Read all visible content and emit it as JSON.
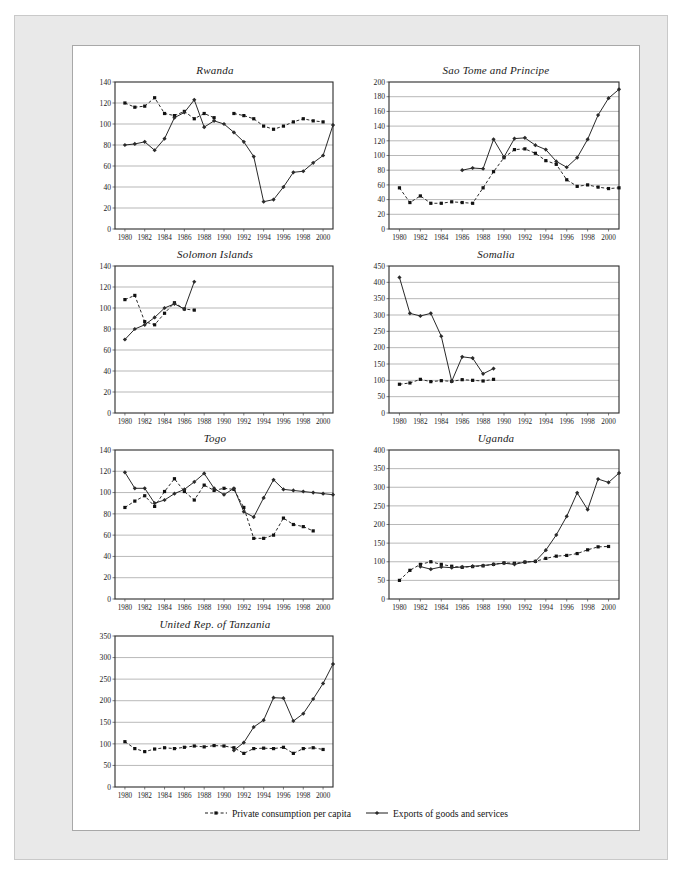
{
  "legend": [
    {
      "label": "Private consumption per capita",
      "marker": "square",
      "dash": true
    },
    {
      "label": "Exports of goods and services",
      "marker": "diamond",
      "dash": false
    }
  ],
  "series_names": {
    "consumption": "Private consumption per capita",
    "exports": "Exports of goods and services"
  },
  "xticks": [
    "1980",
    "1982",
    "1984",
    "1986",
    "1988",
    "1990",
    "1992",
    "1994",
    "1996",
    "1998",
    "2000"
  ],
  "chart_data": [
    {
      "type": "line",
      "title": "Rwanda",
      "xlabel": "",
      "ylabel": "",
      "grid": true,
      "legend_position": "bottom-shared",
      "xlim": [
        1979,
        2001
      ],
      "ylim": [
        0,
        140
      ],
      "yticks": [
        0,
        20,
        40,
        60,
        80,
        100,
        120,
        140
      ],
      "x": [
        1980,
        1981,
        1982,
        1983,
        1984,
        1985,
        1986,
        1987,
        1988,
        1989,
        1990,
        1991,
        1992,
        1993,
        1994,
        1995,
        1996,
        1997,
        1998,
        1999,
        2000,
        2001
      ],
      "series": [
        {
          "name": "Private consumption per capita",
          "marker": "square",
          "dash": true,
          "values": [
            120,
            116,
            117,
            125,
            110,
            108,
            112,
            105,
            110,
            106,
            null,
            110,
            108,
            105,
            98,
            95,
            98,
            102,
            105,
            103,
            102,
            null
          ]
        },
        {
          "name": "Exports of goods and services",
          "marker": "diamond",
          "dash": false,
          "values": [
            80,
            81,
            83,
            75,
            86,
            106,
            111,
            123,
            97,
            103,
            100,
            92,
            83,
            69,
            26,
            28,
            40,
            54,
            55,
            63,
            70,
            99
          ]
        }
      ]
    },
    {
      "type": "line",
      "title": "Sao Tome and Principe",
      "xlabel": "",
      "ylabel": "",
      "grid": true,
      "legend_position": "bottom-shared",
      "xlim": [
        1979,
        2001
      ],
      "ylim": [
        0,
        200
      ],
      "yticks": [
        0,
        20,
        40,
        60,
        80,
        100,
        120,
        140,
        160,
        180,
        200
      ],
      "x": [
        1980,
        1981,
        1982,
        1983,
        1984,
        1985,
        1986,
        1987,
        1988,
        1989,
        1990,
        1991,
        1992,
        1993,
        1994,
        1995,
        1996,
        1997,
        1998,
        1999,
        2000,
        2001
      ],
      "series": [
        {
          "name": "Private consumption per capita",
          "marker": "square",
          "dash": true,
          "values": [
            56,
            36,
            45,
            35,
            35,
            37,
            36,
            35,
            56,
            78,
            97,
            108,
            109,
            103,
            93,
            88,
            67,
            58,
            60,
            57,
            55,
            56
          ]
        },
        {
          "name": "Exports of goods and services",
          "marker": "diamond",
          "dash": false,
          "values": [
            null,
            null,
            null,
            null,
            null,
            null,
            80,
            83,
            82,
            122,
            98,
            123,
            124,
            114,
            108,
            92,
            84,
            97,
            122,
            155,
            178,
            190
          ]
        }
      ]
    },
    {
      "type": "line",
      "title": "Solomon Islands",
      "xlabel": "",
      "ylabel": "",
      "grid": true,
      "legend_position": "bottom-shared",
      "xlim": [
        1979,
        2001
      ],
      "ylim": [
        0,
        140
      ],
      "yticks": [
        0,
        20,
        40,
        60,
        80,
        100,
        120,
        140
      ],
      "x": [
        1980,
        1981,
        1982,
        1983,
        1984,
        1985,
        1986,
        1987,
        1988,
        1989,
        1990,
        1991,
        1992,
        1993,
        1994,
        1995,
        1996,
        1997,
        1998,
        1999,
        2000,
        2001
      ],
      "series": [
        {
          "name": "Private consumption per capita",
          "marker": "square",
          "dash": true,
          "values": [
            108,
            112,
            87,
            84,
            95,
            105,
            99,
            98,
            null,
            null,
            null,
            null,
            null,
            null,
            null,
            null,
            null,
            null,
            null,
            null,
            null,
            null
          ]
        },
        {
          "name": "Exports of goods and services",
          "marker": "diamond",
          "dash": false,
          "values": [
            70,
            80,
            84,
            91,
            100,
            104,
            99,
            125,
            null,
            null,
            null,
            null,
            null,
            null,
            null,
            null,
            null,
            null,
            null,
            null,
            null,
            null
          ]
        }
      ]
    },
    {
      "type": "line",
      "title": "Somalia",
      "xlabel": "",
      "ylabel": "",
      "grid": true,
      "legend_position": "bottom-shared",
      "xlim": [
        1979,
        2001
      ],
      "ylim": [
        0,
        450
      ],
      "yticks": [
        0,
        50,
        100,
        150,
        200,
        250,
        300,
        350,
        400,
        450
      ],
      "x": [
        1980,
        1981,
        1982,
        1983,
        1984,
        1985,
        1986,
        1987,
        1988,
        1989,
        1990,
        1991,
        1992,
        1993,
        1994,
        1995,
        1996,
        1997,
        1998,
        1999,
        2000,
        2001
      ],
      "series": [
        {
          "name": "Private consumption per capita",
          "marker": "square",
          "dash": true,
          "values": [
            88,
            92,
            103,
            96,
            99,
            97,
            102,
            100,
            98,
            103,
            null,
            null,
            null,
            null,
            null,
            null,
            null,
            null,
            null,
            null,
            null,
            null
          ]
        },
        {
          "name": "Exports of goods and services",
          "marker": "diamond",
          "dash": false,
          "values": [
            415,
            305,
            297,
            305,
            235,
            97,
            172,
            168,
            120,
            136,
            null,
            null,
            null,
            null,
            null,
            null,
            null,
            null,
            null,
            null,
            null,
            null
          ]
        }
      ]
    },
    {
      "type": "line",
      "title": "Togo",
      "xlabel": "",
      "ylabel": "",
      "grid": true,
      "legend_position": "bottom-shared",
      "xlim": [
        1979,
        2001
      ],
      "ylim": [
        0,
        140
      ],
      "yticks": [
        0,
        20,
        40,
        60,
        80,
        100,
        120,
        140
      ],
      "x": [
        1980,
        1981,
        1982,
        1983,
        1984,
        1985,
        1986,
        1987,
        1988,
        1989,
        1990,
        1991,
        1992,
        1993,
        1994,
        1995,
        1996,
        1997,
        1998,
        1999,
        2000,
        2001
      ],
      "series": [
        {
          "name": "Private consumption per capita",
          "marker": "square",
          "dash": true,
          "values": [
            86,
            92,
            97,
            87,
            101,
            113,
            101,
            93,
            107,
            102,
            104,
            103,
            86,
            57,
            57,
            60,
            76,
            70,
            68,
            64,
            null,
            null
          ]
        },
        {
          "name": "Exports of goods and services",
          "marker": "diamond",
          "dash": false,
          "values": [
            119,
            104,
            104,
            90,
            93,
            99,
            103,
            110,
            118,
            104,
            98,
            104,
            82,
            77,
            95,
            112,
            103,
            102,
            101,
            100,
            99,
            98
          ]
        }
      ]
    },
    {
      "type": "line",
      "title": "Uganda",
      "xlabel": "",
      "ylabel": "",
      "grid": true,
      "legend_position": "bottom-shared",
      "xlim": [
        1979,
        2001
      ],
      "ylim": [
        0,
        400
      ],
      "yticks": [
        0,
        50,
        100,
        150,
        200,
        250,
        300,
        350,
        400
      ],
      "x": [
        1980,
        1981,
        1982,
        1983,
        1984,
        1985,
        1986,
        1987,
        1988,
        1989,
        1990,
        1991,
        1992,
        1993,
        1994,
        1995,
        1996,
        1997,
        1998,
        1999,
        2000,
        2001
      ],
      "series": [
        {
          "name": "Private consumption per capita",
          "marker": "square",
          "dash": true,
          "values": [
            50,
            77,
            93,
            100,
            93,
            88,
            85,
            87,
            89,
            93,
            97,
            96,
            99,
            101,
            109,
            115,
            117,
            122,
            132,
            140,
            141,
            null
          ]
        },
        {
          "name": "Exports of goods and services",
          "marker": "diamond",
          "dash": false,
          "values": [
            null,
            null,
            87,
            80,
            86,
            84,
            86,
            88,
            90,
            93,
            96,
            93,
            99,
            101,
            131,
            172,
            222,
            285,
            240,
            322,
            313,
            338
          ]
        }
      ]
    },
    {
      "type": "line",
      "title": "United Rep. of Tanzania",
      "xlabel": "",
      "ylabel": "",
      "grid": true,
      "legend_position": "bottom-shared",
      "xlim": [
        1979,
        2001
      ],
      "ylim": [
        0,
        350
      ],
      "yticks": [
        0,
        50,
        100,
        150,
        200,
        250,
        300,
        350
      ],
      "x": [
        1980,
        1981,
        1982,
        1983,
        1984,
        1985,
        1986,
        1987,
        1988,
        1989,
        1990,
        1991,
        1992,
        1993,
        1994,
        1995,
        1996,
        1997,
        1998,
        1999,
        2000,
        2001
      ],
      "series": [
        {
          "name": "Private consumption per capita",
          "marker": "square",
          "dash": true,
          "values": [
            105,
            89,
            82,
            88,
            91,
            89,
            92,
            95,
            93,
            96,
            95,
            91,
            78,
            89,
            90,
            89,
            92,
            78,
            89,
            91,
            87,
            null
          ]
        },
        {
          "name": "Exports of goods and services",
          "marker": "diamond",
          "dash": false,
          "values": [
            null,
            null,
            null,
            null,
            null,
            null,
            null,
            null,
            null,
            null,
            null,
            85,
            103,
            139,
            155,
            207,
            206,
            153,
            170,
            204,
            240,
            285
          ]
        }
      ]
    }
  ]
}
